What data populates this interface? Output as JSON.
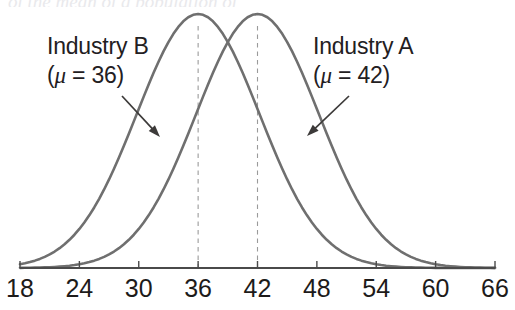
{
  "figure": {
    "background_color": "#ffffff",
    "width": 515,
    "height": 310,
    "top_caption_remnant": "of the mean of a population of"
  },
  "chart_data": {
    "type": "line",
    "title": "",
    "subtitle": "",
    "xlabel": "",
    "ylabel": "",
    "xlim": [
      18,
      66
    ],
    "ylim": [
      0,
      1.0
    ],
    "grid": false,
    "legend_position": "inline-annotations",
    "axis": {
      "line_color": "#4a4a4a",
      "tick_values": [
        18,
        24,
        30,
        36,
        42,
        48,
        54,
        60,
        66
      ],
      "tick_labels": [
        "18",
        "24",
        "30",
        "36",
        "42",
        "48",
        "54",
        "60",
        "66"
      ],
      "tick_interval": 6
    },
    "curve_color": "#6f6f6f",
    "reference_line_color": "#9a9a9a",
    "reference_line_style": "dashed",
    "series": [
      {
        "name": "Industry B",
        "mean": 36,
        "std": 6.2,
        "peak_x": 36,
        "peak_y": 1.0,
        "color": "#6f6f6f",
        "x": [
          18,
          20,
          22,
          24,
          26,
          28,
          30,
          32,
          34,
          36,
          38,
          40,
          42,
          44,
          46,
          48,
          50,
          52,
          54,
          56,
          58,
          60,
          62,
          64,
          66
        ],
        "values": [
          0.012,
          0.024,
          0.045,
          0.078,
          0.127,
          0.194,
          0.28,
          0.38,
          0.484,
          0.58,
          0.658,
          0.708,
          0.724,
          0.708,
          0.658,
          0.58,
          0.484,
          0.38,
          0.28,
          0.194,
          0.127,
          0.078,
          0.045,
          0.024,
          0.012
        ]
      },
      {
        "name": "Industry A",
        "mean": 42,
        "std": 6.2,
        "peak_x": 42,
        "peak_y": 1.0,
        "color": "#6f6f6f",
        "x": [
          18,
          20,
          22,
          24,
          26,
          28,
          30,
          32,
          34,
          36,
          38,
          40,
          42,
          44,
          46,
          48,
          50,
          52,
          54,
          56,
          58,
          60,
          62,
          64,
          66
        ],
        "values": [
          0.001,
          0.003,
          0.006,
          0.012,
          0.024,
          0.045,
          0.078,
          0.127,
          0.194,
          0.28,
          0.38,
          0.484,
          0.58,
          0.658,
          0.708,
          0.724,
          0.708,
          0.658,
          0.58,
          0.484,
          0.38,
          0.28,
          0.194,
          0.127,
          0.078
        ]
      }
    ],
    "annotations": [
      {
        "id": "industry-b",
        "line1": "Industry B",
        "line2_prefix": "(",
        "line2_mu": "μ",
        "line2_suffix": " = 36)",
        "arrow_from": [
          122,
          96
        ],
        "arrow_to": [
          160,
          137
        ],
        "points_to": "Industry B"
      },
      {
        "id": "industry-a",
        "line1": "Industry A",
        "line2_prefix": "(",
        "line2_mu": "μ",
        "line2_suffix": " = 42)",
        "arrow_from": [
          349,
          96
        ],
        "arrow_to": [
          307,
          136
        ],
        "points_to": "Industry A"
      }
    ],
    "reference_lines": [
      {
        "x": 36,
        "label": "Industry B mean",
        "style": "dashed"
      },
      {
        "x": 42,
        "label": "Industry A mean",
        "style": "dashed"
      }
    ]
  }
}
